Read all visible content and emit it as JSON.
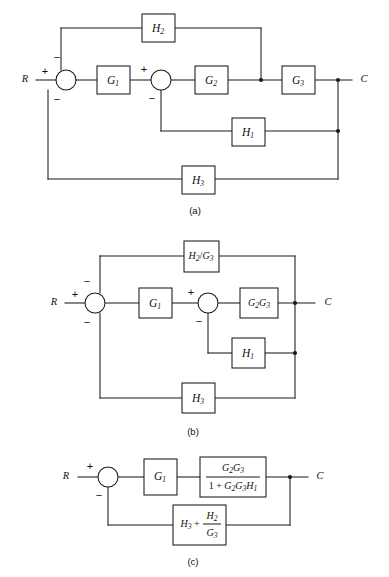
{
  "figure": {
    "type": "control-system-block-diagram",
    "background_color": "#ffffff",
    "line_color": "#1a1a1a",
    "text_color": "#111111",
    "panels": [
      {
        "id": "a",
        "caption": "(a)",
        "input_label": "R",
        "output_label": "C",
        "summing_junctions": [
          {
            "name": "sum-1",
            "signs": {
              "left": "+",
              "top": "−",
              "bottom": "−"
            }
          },
          {
            "name": "sum-2",
            "signs": {
              "left": "+",
              "bottom": "−"
            }
          }
        ],
        "blocks": [
          {
            "name": "block-h2",
            "label": "H",
            "subscript": "2"
          },
          {
            "name": "block-g1",
            "label": "G",
            "subscript": "1"
          },
          {
            "name": "block-g2",
            "label": "G",
            "subscript": "2"
          },
          {
            "name": "block-g3",
            "label": "G",
            "subscript": "3"
          },
          {
            "name": "block-h1",
            "label": "H",
            "subscript": "1"
          },
          {
            "name": "block-h3",
            "label": "H",
            "subscript": "3"
          }
        ]
      },
      {
        "id": "b",
        "caption": "(b)",
        "input_label": "R",
        "output_label": "C",
        "summing_junctions": [
          {
            "name": "sum-1",
            "signs": {
              "left": "+",
              "top": "−",
              "bottom": "−"
            }
          },
          {
            "name": "sum-2",
            "signs": {
              "left": "+",
              "bottom": "−"
            }
          }
        ],
        "blocks": [
          {
            "name": "block-h2-over-g3",
            "numerator": "H",
            "numerator_sub": "2",
            "divider": "/",
            "denominator": "G",
            "denominator_sub": "3"
          },
          {
            "name": "block-g1",
            "label": "G",
            "subscript": "1"
          },
          {
            "name": "block-g2g3",
            "label": "G",
            "subscript": "2",
            "label2": "G",
            "subscript2": "3"
          },
          {
            "name": "block-h1",
            "label": "H",
            "subscript": "1"
          },
          {
            "name": "block-h3",
            "label": "H",
            "subscript": "3"
          }
        ]
      },
      {
        "id": "c",
        "caption": "(c)",
        "input_label": "R",
        "output_label": "C",
        "summing_junctions": [
          {
            "name": "sum-1",
            "signs": {
              "left": "+",
              "bottom": "−"
            }
          }
        ],
        "blocks": [
          {
            "name": "block-g1",
            "label": "G",
            "subscript": "1"
          },
          {
            "name": "block-closed-loop-fraction",
            "numerator_text": "G2G3",
            "denominator_text": "1 + G2G3H1"
          },
          {
            "name": "block-feedback-sum",
            "text": "H3 + H2/G3"
          }
        ]
      }
    ]
  },
  "labels": {
    "R": "R",
    "C": "C",
    "G": "G",
    "H": "H",
    "one": "1",
    "two": "2",
    "three": "3",
    "plus": "+",
    "minus": "−",
    "slash": "/",
    "plus_op": "+",
    "digit_one": "1",
    "caption_a": "(a)",
    "caption_b": "(b)",
    "caption_c": "(c)"
  }
}
